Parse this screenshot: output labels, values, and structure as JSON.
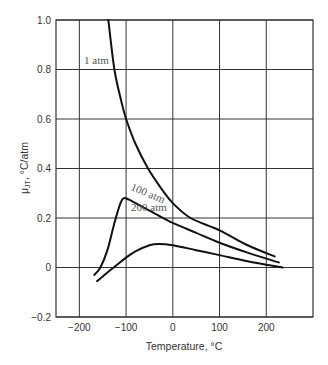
{
  "chart_data": {
    "type": "line",
    "title": "",
    "xlabel": "Temperature, °C",
    "ylabel": "μJT, °C/atm",
    "xlim": [
      -250,
      300
    ],
    "ylim": [
      -0.2,
      1.0
    ],
    "grid": true,
    "legend": "none (inline curve labels)",
    "x_ticks": [
      -200,
      -100,
      0,
      100,
      200
    ],
    "x_tick_labels": [
      "−200",
      "−100",
      "0",
      "100",
      "200"
    ],
    "y_ticks": [
      -0.2,
      0,
      0.2,
      0.4,
      0.6,
      0.8,
      1.0
    ],
    "y_tick_labels": [
      "−0.2",
      "0",
      "0.2",
      "0.4",
      "0.6",
      "0.8",
      "1.0"
    ],
    "series": [
      {
        "name": "1 atm",
        "label": "1 atm",
        "x": [
          -138,
          -125,
          -110,
          -100,
          -80,
          -53,
          -25,
          0,
          38,
          100,
          160,
          218
        ],
        "y": [
          1.0,
          0.8,
          0.67,
          0.6,
          0.5,
          0.4,
          0.32,
          0.26,
          0.2,
          0.15,
          0.09,
          0.045
        ]
      },
      {
        "name": "100 atm",
        "label": "100 atm",
        "x": [
          -168,
          -155,
          -140,
          -125,
          -112,
          -105,
          -95,
          -70,
          -40,
          0,
          50,
          100,
          160,
          227
        ],
        "y": [
          -0.03,
          0.0,
          0.07,
          0.18,
          0.26,
          0.28,
          0.275,
          0.25,
          0.22,
          0.18,
          0.14,
          0.1,
          0.06,
          0.02
        ]
      },
      {
        "name": "200 atm",
        "label": "200 atm",
        "x": [
          -162,
          -140,
          -120,
          -100,
          -80,
          -50,
          -30,
          0,
          50,
          100,
          160,
          235
        ],
        "y": [
          -0.055,
          -0.02,
          0.01,
          0.04,
          0.065,
          0.09,
          0.095,
          0.09,
          0.07,
          0.05,
          0.025,
          0.0
        ]
      }
    ]
  },
  "axes": {
    "xlabel": "Temperature, °C",
    "ylabel_main": "μ",
    "ylabel_sub": "JT",
    "ylabel_rest": ", °C/atm"
  },
  "curve_labels": {
    "atm1": "1 atm",
    "atm100": "100 atm",
    "atm200": "200 atm"
  }
}
